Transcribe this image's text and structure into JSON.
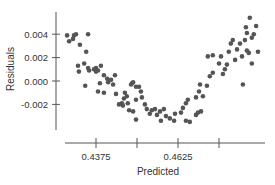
{
  "chart_data": {
    "type": "scatter",
    "title": "",
    "xlabel": "Predicted",
    "ylabel": "Residuals",
    "xlim": [
      0.4205,
      0.4895
    ],
    "ylim": [
      -0.0052,
      0.0068
    ],
    "grid": false,
    "legend": null,
    "x_ticks": [
      0.4375,
      0.45,
      0.4625,
      0.475
    ],
    "x_tick_labels": [
      "0.4375",
      "",
      "0.4625",
      ""
    ],
    "y_ticks": [
      0.004,
      0.002,
      0.0,
      -0.002
    ],
    "y_tick_labels": [
      "0.004",
      "0.002",
      "0.000",
      "-0.002"
    ],
    "marker_color": "#555555",
    "points": [
      [
        0.4287,
        0.0039
      ],
      [
        0.4293,
        0.0034
      ],
      [
        0.4305,
        0.0036
      ],
      [
        0.4308,
        0.0039
      ],
      [
        0.4314,
        0.004
      ],
      [
        0.4326,
        0.0031
      ],
      [
        0.4351,
        0.004
      ],
      [
        0.4345,
        0.0025
      ],
      [
        0.432,
        0.0013
      ],
      [
        0.4323,
        0.0008
      ],
      [
        0.4339,
        0.0015
      ],
      [
        0.4351,
        0.0011
      ],
      [
        0.4354,
        0.0009
      ],
      [
        0.4369,
        0.001
      ],
      [
        0.4375,
        0.0008
      ],
      [
        0.4375,
        0.0011
      ],
      [
        0.4381,
        0.0009
      ],
      [
        0.439,
        0.0013
      ],
      [
        0.4387,
        -0.0002
      ],
      [
        0.4342,
        -0.0004
      ],
      [
        0.4399,
        0.0005
      ],
      [
        0.4409,
        0.0002
      ],
      [
        0.4412,
        -0.0001
      ],
      [
        0.4421,
        0.0001
      ],
      [
        0.4427,
        -0.0003
      ],
      [
        0.4433,
        0.0005
      ],
      [
        0.4436,
        -0.0011
      ],
      [
        0.4399,
        -0.001
      ],
      [
        0.4381,
        -0.0009
      ],
      [
        0.446,
        -0.0015
      ],
      [
        0.4445,
        -0.002
      ],
      [
        0.4454,
        -0.0019
      ],
      [
        0.4457,
        -0.0021
      ],
      [
        0.4463,
        -0.001
      ],
      [
        0.4469,
        -0.0013
      ],
      [
        0.4472,
        -0.0019
      ],
      [
        0.4476,
        -0.0025
      ],
      [
        0.4488,
        -0.0026
      ],
      [
        0.4497,
        -0.0016
      ],
      [
        0.4497,
        -0.0005
      ],
      [
        0.4488,
        -0.0001
      ],
      [
        0.4485,
        -0.0002
      ],
      [
        0.4482,
        -0.0003
      ],
      [
        0.4506,
        -0.0005
      ],
      [
        0.4512,
        -0.0009
      ],
      [
        0.4515,
        -0.0014
      ],
      [
        0.4497,
        -0.0033
      ],
      [
        0.4524,
        -0.002
      ],
      [
        0.453,
        -0.0024
      ],
      [
        0.4545,
        -0.0025
      ],
      [
        0.4539,
        -0.0028
      ],
      [
        0.4561,
        -0.0029
      ],
      [
        0.4555,
        -0.0024
      ],
      [
        0.457,
        -0.0026
      ],
      [
        0.4582,
        -0.0024
      ],
      [
        0.4588,
        -0.003
      ],
      [
        0.4573,
        -0.0034
      ],
      [
        0.46,
        -0.0032
      ],
      [
        0.4613,
        -0.0034
      ],
      [
        0.4616,
        -0.0028
      ],
      [
        0.4634,
        -0.0027
      ],
      [
        0.464,
        -0.0023
      ],
      [
        0.4649,
        -0.0019
      ],
      [
        0.4655,
        -0.0016
      ],
      [
        0.4649,
        -0.0034
      ],
      [
        0.4661,
        -0.0035
      ],
      [
        0.468,
        -0.0029
      ],
      [
        0.4686,
        -0.0027
      ],
      [
        0.4695,
        -0.0026
      ],
      [
        0.468,
        -0.0014
      ],
      [
        0.4689,
        -0.0009
      ],
      [
        0.4701,
        -0.0013
      ],
      [
        0.4692,
        -0.0003
      ],
      [
        0.4713,
        -0.0004
      ],
      [
        0.4722,
        0.0004
      ],
      [
        0.4731,
        0.0007
      ],
      [
        0.4716,
        0.0021
      ],
      [
        0.4731,
        0.0022
      ],
      [
        0.475,
        0.0015
      ],
      [
        0.4756,
        0.0021
      ],
      [
        0.4768,
        0.001
      ],
      [
        0.4762,
        0.0006
      ],
      [
        0.4774,
        0.0014
      ],
      [
        0.478,
        0.0025
      ],
      [
        0.4799,
        0.0018
      ],
      [
        0.4805,
        0.0027
      ],
      [
        0.4786,
        0.0032
      ],
      [
        0.4792,
        0.0035
      ],
      [
        0.4814,
        0.0032
      ],
      [
        0.4829,
        0.0035
      ],
      [
        0.4835,
        0.0026
      ],
      [
        0.482,
        0.0021
      ],
      [
        0.4841,
        0.0024
      ],
      [
        0.485,
        0.0037
      ],
      [
        0.4856,
        0.004
      ],
      [
        0.4863,
        0.0047
      ],
      [
        0.4844,
        0.0054
      ],
      [
        0.4832,
        0.0046
      ],
      [
        0.4835,
        0.0041
      ],
      [
        0.4869,
        0.0025
      ],
      [
        0.485,
        0.0015
      ],
      [
        0.4823,
        -0.0003
      ]
    ]
  }
}
